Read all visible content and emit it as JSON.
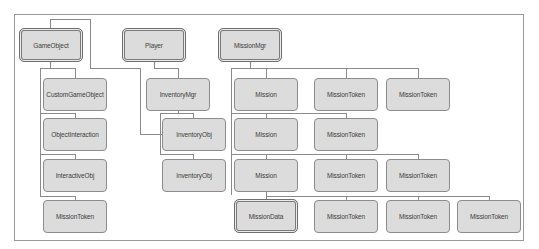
{
  "colors": {
    "node_fill": "#dcdcdc",
    "node_border": "#8c8c8c",
    "connector": "#8a8a8a",
    "text": "#3c3c3c",
    "frame": "#9a9a9a"
  },
  "frame": {
    "x": 14,
    "y": 14,
    "w": 510,
    "h": 227
  },
  "nodes": [
    {
      "id": "gameobject",
      "label": "GameObject",
      "x": 19,
      "y": 28,
      "w": 64,
      "h": 34,
      "double": true
    },
    {
      "id": "player",
      "label": "Player",
      "x": 122,
      "y": 28,
      "w": 64,
      "h": 34,
      "double": true
    },
    {
      "id": "missionmgr",
      "label": "MissionMgr",
      "x": 218,
      "y": 28,
      "w": 64,
      "h": 34,
      "double": true
    },
    {
      "id": "customgameobject",
      "label": "CustomGameObject",
      "x": 43,
      "y": 78,
      "w": 64,
      "h": 33,
      "double": false
    },
    {
      "id": "objectinteraction",
      "label": "ObjectInteraction",
      "x": 43,
      "y": 118,
      "w": 64,
      "h": 33,
      "double": false
    },
    {
      "id": "interactiveobj",
      "label": "InteractiveObj",
      "x": 43,
      "y": 159,
      "w": 64,
      "h": 33,
      "double": false
    },
    {
      "id": "missiontoken-left",
      "label": "MissionToken",
      "x": 43,
      "y": 200,
      "w": 64,
      "h": 33,
      "double": false
    },
    {
      "id": "inventorymgr",
      "label": "InventoryMgr",
      "x": 146,
      "y": 78,
      "w": 64,
      "h": 33,
      "double": false
    },
    {
      "id": "inventoryobj-1",
      "label": "InventoryObj",
      "x": 162,
      "y": 118,
      "w": 64,
      "h": 33,
      "double": false
    },
    {
      "id": "inventoryobj-2",
      "label": "InventoryObj",
      "x": 162,
      "y": 159,
      "w": 64,
      "h": 33,
      "double": false
    },
    {
      "id": "mission-1",
      "label": "Mission",
      "x": 234,
      "y": 78,
      "w": 64,
      "h": 33,
      "double": false
    },
    {
      "id": "missiontoken-r1-1",
      "label": "MissionToken",
      "x": 314,
      "y": 78,
      "w": 64,
      "h": 33,
      "double": false
    },
    {
      "id": "missiontoken-r1-2",
      "label": "MissionToken",
      "x": 386,
      "y": 78,
      "w": 64,
      "h": 33,
      "double": false
    },
    {
      "id": "mission-2",
      "label": "Mission",
      "x": 234,
      "y": 118,
      "w": 64,
      "h": 33,
      "double": false
    },
    {
      "id": "missiontoken-r2-1",
      "label": "MissionToken",
      "x": 314,
      "y": 118,
      "w": 64,
      "h": 33,
      "double": false
    },
    {
      "id": "mission-3",
      "label": "Mission",
      "x": 234,
      "y": 159,
      "w": 64,
      "h": 33,
      "double": false
    },
    {
      "id": "missiontoken-r3-1",
      "label": "MissionToken",
      "x": 314,
      "y": 159,
      "w": 64,
      "h": 33,
      "double": false
    },
    {
      "id": "missiontoken-r3-2",
      "label": "MissionToken",
      "x": 386,
      "y": 159,
      "w": 64,
      "h": 33,
      "double": false
    },
    {
      "id": "missiondata",
      "label": "MissionData",
      "x": 234,
      "y": 199,
      "w": 64,
      "h": 34,
      "double": true
    },
    {
      "id": "missiontoken-r4-1",
      "label": "MissionToken",
      "x": 314,
      "y": 200,
      "w": 64,
      "h": 33,
      "double": false
    },
    {
      "id": "missiontoken-r4-2",
      "label": "MissionToken",
      "x": 386,
      "y": 200,
      "w": 64,
      "h": 33,
      "double": false
    },
    {
      "id": "missiontoken-r4-3",
      "label": "MissionToken",
      "x": 457,
      "y": 200,
      "w": 64,
      "h": 33,
      "double": false
    }
  ],
  "connectors": {
    "h": [
      {
        "x": 50,
        "y": 19,
        "len": 40
      },
      {
        "x": 90,
        "y": 68,
        "len": 50
      },
      {
        "x": 140,
        "y": 134,
        "len": 22
      },
      {
        "x": 40,
        "y": 68,
        "len": 35
      },
      {
        "x": 40,
        "y": 113,
        "len": 35
      },
      {
        "x": 40,
        "y": 154,
        "len": 35
      },
      {
        "x": 40,
        "y": 196,
        "len": 35
      },
      {
        "x": 154,
        "y": 68,
        "len": 24
      },
      {
        "x": 160,
        "y": 113,
        "len": 33
      },
      {
        "x": 160,
        "y": 154,
        "len": 33
      },
      {
        "x": 231,
        "y": 68,
        "len": 187
      },
      {
        "x": 231,
        "y": 113,
        "len": 115
      },
      {
        "x": 231,
        "y": 154,
        "len": 187
      },
      {
        "x": 266,
        "y": 196,
        "len": 223
      }
    ],
    "v": [
      {
        "x": 50,
        "y": 19,
        "len": 9
      },
      {
        "x": 90,
        "y": 19,
        "len": 49
      },
      {
        "x": 140,
        "y": 68,
        "len": 66
      },
      {
        "x": 50,
        "y": 62,
        "len": 6
      },
      {
        "x": 40,
        "y": 68,
        "len": 128
      },
      {
        "x": 75,
        "y": 68,
        "len": 10
      },
      {
        "x": 75,
        "y": 113,
        "len": 5
      },
      {
        "x": 75,
        "y": 154,
        "len": 5
      },
      {
        "x": 75,
        "y": 196,
        "len": 4
      },
      {
        "x": 154,
        "y": 62,
        "len": 6
      },
      {
        "x": 178,
        "y": 68,
        "len": 10
      },
      {
        "x": 178,
        "y": 111,
        "len": 2
      },
      {
        "x": 160,
        "y": 113,
        "len": 41
      },
      {
        "x": 193,
        "y": 113,
        "len": 5
      },
      {
        "x": 193,
        "y": 154,
        "len": 5
      },
      {
        "x": 250,
        "y": 62,
        "len": 6
      },
      {
        "x": 231,
        "y": 68,
        "len": 127
      },
      {
        "x": 266,
        "y": 68,
        "len": 10
      },
      {
        "x": 346,
        "y": 68,
        "len": 10
      },
      {
        "x": 418,
        "y": 68,
        "len": 10
      },
      {
        "x": 266,
        "y": 113,
        "len": 5
      },
      {
        "x": 346,
        "y": 113,
        "len": 5
      },
      {
        "x": 266,
        "y": 154,
        "len": 5
      },
      {
        "x": 346,
        "y": 154,
        "len": 5
      },
      {
        "x": 418,
        "y": 154,
        "len": 5
      },
      {
        "x": 266,
        "y": 192,
        "len": 7
      },
      {
        "x": 346,
        "y": 196,
        "len": 4
      },
      {
        "x": 418,
        "y": 196,
        "len": 4
      },
      {
        "x": 489,
        "y": 196,
        "len": 4
      }
    ]
  }
}
